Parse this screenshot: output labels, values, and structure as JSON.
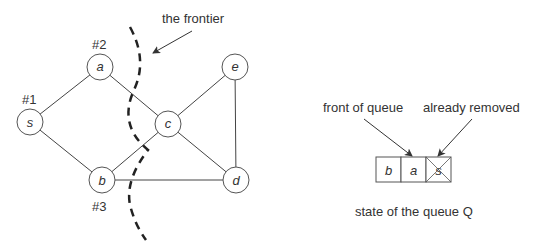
{
  "graph": {
    "nodes": [
      {
        "id": "s",
        "label": "s",
        "x": 30,
        "y": 122,
        "order_label": "#1"
      },
      {
        "id": "a",
        "label": "a",
        "x": 100,
        "y": 67,
        "order_label": "#2"
      },
      {
        "id": "b",
        "label": "b",
        "x": 102,
        "y": 180,
        "order_label": "#3"
      },
      {
        "id": "c",
        "label": "c",
        "x": 168,
        "y": 124
      },
      {
        "id": "e",
        "label": "e",
        "x": 235,
        "y": 67
      },
      {
        "id": "d",
        "label": "d",
        "x": 236,
        "y": 180
      }
    ],
    "edges": [
      [
        "s",
        "a"
      ],
      [
        "s",
        "b"
      ],
      [
        "a",
        "c"
      ],
      [
        "b",
        "c"
      ],
      [
        "b",
        "d"
      ],
      [
        "c",
        "e"
      ],
      [
        "c",
        "d"
      ],
      [
        "e",
        "d"
      ]
    ],
    "frontier_label": "the frontier"
  },
  "queue": {
    "cells": [
      "b",
      "a",
      "s"
    ],
    "removed_index": 2,
    "front_label": "front of queue",
    "removed_label": "already removed",
    "caption": "state of the queue Q"
  }
}
